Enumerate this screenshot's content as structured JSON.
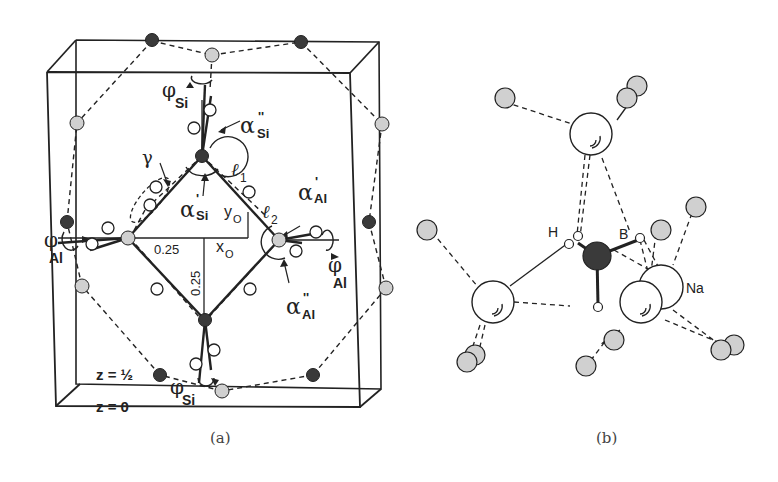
{
  "figure": {
    "panels": [
      {
        "caption": "(a)",
        "labels": {
          "phi": "φ",
          "si": "Si",
          "al": "Al",
          "alpha": "α",
          "prime": "'",
          "dprime": "''",
          "gamma": "γ",
          "l": "ℓ",
          "one": "1",
          "two": "2",
          "y": "y",
          "x": "x",
          "o": "O",
          "quarter_h": "0.25",
          "quarter_v": "0.25",
          "z_half": "z = ½",
          "z_zero": "z = 0"
        }
      },
      {
        "caption": "(b)",
        "labels": {
          "h": "H",
          "b": "B",
          "na": "Na"
        }
      }
    ],
    "colors": {
      "line": "#222222",
      "dark_atom": "#3a3a3a",
      "light_atom": "#d0d0d0",
      "white_atom": "#ffffff",
      "caption": "#444444"
    }
  }
}
